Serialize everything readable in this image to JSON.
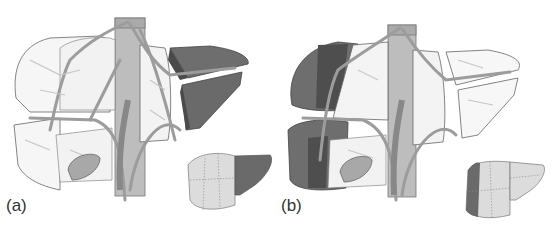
{
  "figure": {
    "panels": [
      {
        "id": "a",
        "label": "(a)",
        "description": "Exploded liver segments with vasculature; left-lateral segments (II/III) highlighted dark",
        "highlight": "left-lateral"
      },
      {
        "id": "b",
        "label": "(b)",
        "description": "Exploded liver segments with vasculature; right-posterior segments (VI/VII) highlighted dark",
        "highlight": "right-posterior"
      }
    ]
  },
  "colors": {
    "background": "#ffffff",
    "outline": "#555555",
    "translucent_lobe": "#f4f4f4",
    "vessel": "#b5b5b5",
    "vessel_dark": "#8f8f8f",
    "vein": "#9a9a9a",
    "highlight_segment": "#6e6e6e",
    "highlight_face": "#505050",
    "small_liver": "#dcdcdc",
    "gallbladder": "#a8a8a8"
  }
}
